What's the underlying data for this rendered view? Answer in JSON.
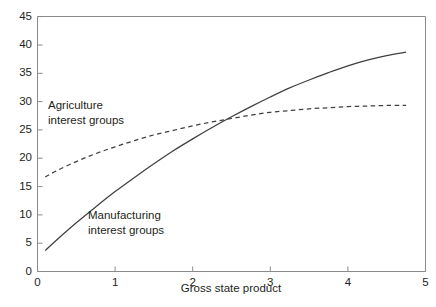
{
  "figure": {
    "width": 436,
    "height": 307,
    "background_color": "#ffffff",
    "cropped_title_fragment": ""
  },
  "chart_data": {
    "type": "line",
    "title": "",
    "subtitle": "",
    "xlabel": "Gross state product",
    "ylabel": "",
    "xlim": [
      0,
      5
    ],
    "ylim": [
      0,
      45
    ],
    "xticks": [
      0,
      1,
      2,
      3,
      4,
      5
    ],
    "xtick_labels": [
      "0",
      "1",
      "2",
      "3",
      "4",
      "5"
    ],
    "yticks": [
      0,
      5,
      10,
      15,
      20,
      25,
      30,
      35,
      40,
      45
    ],
    "ytick_labels": [
      "0",
      "5",
      "10",
      "15",
      "20",
      "25",
      "30",
      "35",
      "40",
      "45"
    ],
    "grid": false,
    "legend_position": "inline-annotations",
    "line_color": "#3f3f3f",
    "axis_color": "#808080",
    "text_color": "#231f20",
    "series": [
      {
        "name": "Agriculture interest groups",
        "label_lines": [
          "Agriculture",
          "interest groups"
        ],
        "style": "dashed",
        "color": "#3f3f3f",
        "x": [
          0.1,
          0.25,
          0.5,
          0.75,
          1.0,
          1.25,
          1.5,
          1.75,
          2.0,
          2.25,
          2.5,
          2.75,
          3.0,
          3.25,
          3.5,
          3.75,
          4.0,
          4.25,
          4.5,
          4.75
        ],
        "y": [
          16.7,
          17.8,
          19.4,
          20.8,
          22.0,
          23.1,
          24.1,
          24.9,
          25.7,
          26.4,
          27.0,
          27.6,
          28.1,
          28.4,
          28.7,
          28.9,
          29.1,
          29.2,
          29.3,
          29.3
        ]
      },
      {
        "name": "Manufacturing interest groups",
        "label_lines": [
          "Manufacturing",
          "interest groups"
        ],
        "style": "solid",
        "color": "#3f3f3f",
        "x": [
          0.1,
          0.25,
          0.5,
          0.75,
          1.0,
          1.25,
          1.5,
          1.75,
          2.0,
          2.25,
          2.5,
          2.75,
          3.0,
          3.25,
          3.5,
          3.75,
          4.0,
          4.25,
          4.5,
          4.75
        ],
        "y": [
          3.7,
          5.6,
          8.6,
          11.4,
          14.1,
          16.6,
          19.0,
          21.3,
          23.4,
          25.4,
          27.3,
          29.1,
          30.8,
          32.4,
          33.8,
          35.1,
          36.3,
          37.3,
          38.1,
          38.7
        ]
      }
    ],
    "annotations": [
      {
        "text": "Agriculture interest groups",
        "x": 0.14,
        "y": 32.5
      },
      {
        "text": "Manufacturing interest groups",
        "x": 0.66,
        "y": 13.0
      }
    ],
    "intersection": {
      "x": 2.54,
      "y": 27.9
    }
  }
}
